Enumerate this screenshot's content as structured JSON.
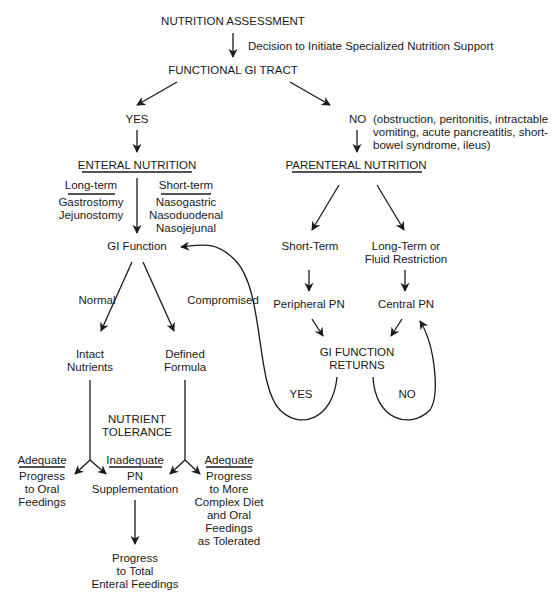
{
  "diagram": {
    "title": "NUTRITION ASSESSMENT",
    "decision_note": "Decision to Initiate Specialized Nutrition Support",
    "functional_gi": "FUNCTIONAL GI TRACT",
    "yes_branch": {
      "label": "YES",
      "enteral": "ENTERAL NUTRITION",
      "long_term": {
        "heading": "Long-term",
        "items": "Gastrostomy\nJejunostomy"
      },
      "short_term": {
        "heading": "Short-term",
        "items": "Nasogastric\nNasoduodenal\nNasojejunal"
      },
      "gi_function": "GI  Function",
      "normal": "Normal",
      "compromised": "Compromised",
      "intact": "Intact\nNutrients",
      "defined": "Defined\nFormula",
      "tolerance": "NUTRIENT\nTOLERANCE",
      "adequate_left": {
        "heading": "Adequate",
        "text": "Progress\nto Oral\nFeedings"
      },
      "inadequate": {
        "heading": "Inadequate",
        "text": "PN\nSupplementation"
      },
      "adequate_right": {
        "heading": "Adequate",
        "text": "Progress\nto More\nComplex Diet\nand Oral\nFeedings\nas Tolerated"
      },
      "final": "Progress\nto Total\nEnteral Feedings"
    },
    "no_branch": {
      "label": "NO",
      "reasons": "(obstruction, peritonitis, intractable\nvomiting, acute pancreatitis, short-\nbowel syndrome, ileus)",
      "parenteral": "PARENTERAL NUTRITION",
      "short_term": "Short-Term",
      "long_term": "Long-Term or\nFluid Restriction",
      "peripheral": "Peripheral PN",
      "central": "Central PN",
      "returns": "GI FUNCTION\nRETURNS",
      "returns_yes": "YES",
      "returns_no": "NO"
    },
    "colors": {
      "ink": "#1a1a1a",
      "background": "#ffffff"
    }
  }
}
